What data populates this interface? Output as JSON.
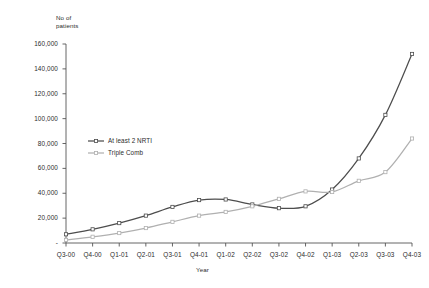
{
  "chart_data": {
    "type": "line",
    "title": "",
    "xlabel": "Year",
    "ylabel": "No of\npatients",
    "ylabel_line1": "No of",
    "ylabel_line2": "patients",
    "categories": [
      "Q3-00",
      "Q4-00",
      "Q1-01",
      "Q2-01",
      "Q3-01",
      "Q4-01",
      "Q1-02",
      "Q2-02",
      "Q3-02",
      "Q4-02",
      "Q1-03",
      "Q2-03",
      "Q3-03",
      "Q4-03"
    ],
    "x": [
      "Q3-00",
      "Q4-00",
      "Q1-01",
      "Q2-01",
      "Q3-01",
      "Q4-01",
      "Q1-02",
      "Q2-02",
      "Q3-02",
      "Q4-02",
      "Q1-03",
      "Q2-03",
      "Q3-03",
      "Q4-03"
    ],
    "series": [
      {
        "name": "At least 2 NRTI",
        "color": "#4d4d4d",
        "values": [
          7000,
          11000,
          16000,
          22000,
          29000,
          34500,
          35000,
          31000,
          28000,
          29500,
          43000,
          68000,
          103000,
          152000
        ]
      },
      {
        "name": "Triple Comb",
        "color": "#b0b0b0",
        "values": [
          2500,
          5000,
          8000,
          12000,
          17000,
          22000,
          25000,
          29500,
          35500,
          41500,
          41000,
          50000,
          57000,
          84000
        ]
      }
    ],
    "yticks": [
      "-",
      "20,000",
      "40,000",
      "60,000",
      "80,000",
      "100,000",
      "120,000",
      "140,000",
      "160,000"
    ],
    "ytick_values": [
      0,
      20000,
      40000,
      60000,
      80000,
      100000,
      120000,
      140000,
      160000
    ],
    "ylim": [
      0,
      160000
    ],
    "grid": false,
    "legend_position": "inside-upper-left",
    "legend": [
      "At least 2 NRTI",
      "Triple Comb"
    ],
    "marker": "square"
  }
}
